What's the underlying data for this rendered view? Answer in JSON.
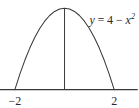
{
  "figure": {
    "title": "",
    "background_color": "#ffffff",
    "stroke_color": "#3a3a3a",
    "text_color": "#2a2a2a"
  },
  "equation": {
    "full_text": "y = 4 - x^2",
    "lhs": "y",
    "equals": "=",
    "constant": "4",
    "minus": "−",
    "variable": "x",
    "exponent": "2"
  },
  "axis": {
    "x_axis_label": "",
    "y_axis_label": "",
    "ticks": [
      {
        "name": "left-root",
        "label": "−2",
        "value": -2
      },
      {
        "name": "right-root",
        "label": "2",
        "value": 2
      }
    ]
  },
  "chart_data": {
    "type": "line",
    "title": "",
    "subtitle": "",
    "xlabel": "",
    "ylabel": "",
    "grid": false,
    "legend": false,
    "annotations": [
      {
        "text": "y = 4 − x²",
        "x": 1.0,
        "y": 3.4
      },
      {
        "text": "−2",
        "x": -2,
        "y": -0.55
      },
      {
        "text": "2",
        "x": 2,
        "y": -0.55
      }
    ],
    "xlim": [
      -2.6,
      3.0
    ],
    "ylim": [
      -0.9,
      4.4
    ],
    "series": [
      {
        "name": "y = 4 - x^2",
        "equation": "y = 4 - x^2",
        "x": [
          -2.0,
          -1.8,
          -1.6,
          -1.4,
          -1.2,
          -1.0,
          -0.8,
          -0.6,
          -0.4,
          -0.2,
          0.0,
          0.2,
          0.4,
          0.6,
          0.8,
          1.0,
          1.2,
          1.4,
          1.6,
          1.8,
          2.0
        ],
        "values": [
          0.0,
          0.76,
          1.44,
          2.04,
          2.56,
          3.0,
          3.36,
          3.64,
          3.84,
          3.96,
          4.0,
          3.96,
          3.84,
          3.64,
          3.36,
          3.0,
          2.56,
          2.04,
          1.44,
          0.76,
          0.0
        ]
      },
      {
        "name": "vertex-vertical-line",
        "x": [
          0.0,
          0.0
        ],
        "values": [
          0.0,
          4.0
        ]
      },
      {
        "name": "x-axis-line",
        "x": [
          -2.65,
          2.95
        ],
        "values": [
          0.0,
          0.0
        ]
      }
    ],
    "roots": [
      -2,
      2
    ],
    "vertex": {
      "x": 0,
      "y": 4
    }
  }
}
